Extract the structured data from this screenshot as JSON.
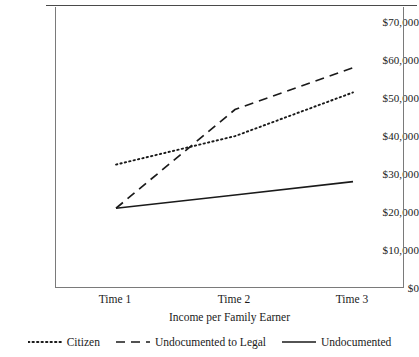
{
  "chart_data": {
    "type": "line",
    "title": "",
    "xlabel": "Income per Family Earner",
    "ylabel": "",
    "categories": [
      "Time 1",
      "Time 2",
      "Time 3"
    ],
    "ylim": [
      0,
      70000
    ],
    "ytick_labels": [
      "$70,000",
      "$60,000",
      "$50,000",
      "$40,000",
      "$30,000",
      "$20,000",
      "$10,000",
      "$0"
    ],
    "ytick_values": [
      70000,
      60000,
      50000,
      40000,
      30000,
      20000,
      10000,
      0
    ],
    "grid": false,
    "legend_position": "bottom",
    "series": [
      {
        "name": "Citizen",
        "style": "dotted",
        "color": "#1a1a1a",
        "values": [
          32500,
          40000,
          51500
        ]
      },
      {
        "name": "Undocumented to Legal",
        "style": "dashed",
        "color": "#1a1a1a",
        "values": [
          21000,
          47000,
          58000
        ]
      },
      {
        "name": "Undocumented",
        "style": "solid",
        "color": "#1a1a1a",
        "values": [
          21000,
          24500,
          28000
        ]
      }
    ]
  }
}
